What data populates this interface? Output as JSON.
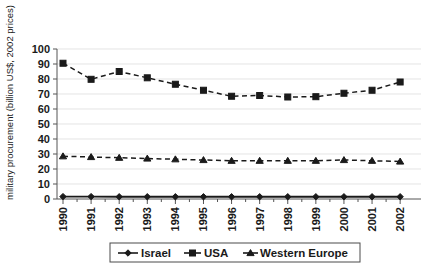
{
  "chart_data": {
    "type": "line",
    "title": "",
    "xlabel": "",
    "ylabel": "military procurement (billion US$, 2002 prices)",
    "x": [
      1990,
      1991,
      1992,
      1993,
      1994,
      1995,
      1996,
      1997,
      1998,
      1999,
      2000,
      2001,
      2002
    ],
    "categories": [
      "1990",
      "1991",
      "1992",
      "1993",
      "1994",
      "1995",
      "1996",
      "1997",
      "1998",
      "1999",
      "2000",
      "2001",
      "2002"
    ],
    "ylim": [
      0,
      100
    ],
    "yticks": [
      0,
      10,
      20,
      30,
      40,
      50,
      60,
      70,
      80,
      90,
      100
    ],
    "ytick_labels": [
      "0",
      "10",
      "20",
      "30",
      "40",
      "50",
      "60",
      "70",
      "80",
      "90",
      "100"
    ],
    "grid": true,
    "grid_axis": "y",
    "legend_position": "bottom",
    "series": [
      {
        "name": "Israel",
        "marker": "diamond",
        "linestyle": "solid",
        "values": [
          1.6,
          1.6,
          1.5,
          1.5,
          1.5,
          1.5,
          1.5,
          1.5,
          1.5,
          1.5,
          1.5,
          1.5,
          1.5
        ]
      },
      {
        "name": "USA",
        "marker": "square",
        "linestyle": "dashed",
        "values": [
          90.5,
          79.8,
          85.0,
          80.8,
          76.5,
          72.5,
          68.5,
          69.0,
          68.0,
          68.2,
          70.5,
          72.5,
          78.0
        ]
      },
      {
        "name": "Western Europe",
        "marker": "triangle",
        "linestyle": "dashed",
        "values": [
          28.5,
          28.0,
          27.5,
          27.0,
          26.5,
          26.0,
          25.5,
          25.5,
          25.5,
          25.5,
          26.0,
          25.5,
          25.0
        ]
      }
    ]
  },
  "legend": {
    "entries": [
      {
        "label": "Israel",
        "marker": "diamond"
      },
      {
        "label": "USA",
        "marker": "square"
      },
      {
        "label": "Western Europe",
        "marker": "triangle"
      }
    ]
  },
  "axis": {
    "y_title": "military procurement (billion US$, 2002 prices)"
  }
}
